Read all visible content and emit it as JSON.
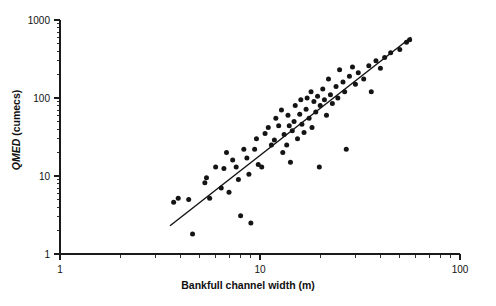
{
  "chart_data": {
    "type": "scatter",
    "title": "",
    "xlabel": "Bankfull channel width (m)",
    "ylabel": "QMED (cumecs)",
    "ylabel_italic_part": "QMED",
    "ylabel_rest": " (cumecs)",
    "xscale": "log",
    "yscale": "log",
    "xlim": [
      1,
      100
    ],
    "ylim": [
      1,
      1000
    ],
    "xticks": [
      1,
      10,
      100
    ],
    "xtick_labels": [
      "1",
      "10",
      "100"
    ],
    "yticks": [
      1,
      10,
      100,
      1000
    ],
    "ytick_labels": [
      "1",
      "10",
      "100",
      "1000"
    ],
    "grid": false,
    "legend": null,
    "series": [
      {
        "name": "Gauged catchments",
        "marker": "filled-circle",
        "color": "#141414",
        "points": [
          [
            3.7,
            4.6
          ],
          [
            3.9,
            5.2
          ],
          [
            4.4,
            5.0
          ],
          [
            4.6,
            1.8
          ],
          [
            5.3,
            8.2
          ],
          [
            5.4,
            9.5
          ],
          [
            5.6,
            5.2
          ],
          [
            6.0,
            13.0
          ],
          [
            6.4,
            7.0
          ],
          [
            6.6,
            12.5
          ],
          [
            6.8,
            20.0
          ],
          [
            7.0,
            6.2
          ],
          [
            7.3,
            16.0
          ],
          [
            7.6,
            13.0
          ],
          [
            7.8,
            9.0
          ],
          [
            8.0,
            3.1
          ],
          [
            8.3,
            22.0
          ],
          [
            8.6,
            17.0
          ],
          [
            8.8,
            10.5
          ],
          [
            9.0,
            2.5
          ],
          [
            9.4,
            22.0
          ],
          [
            9.6,
            30.0
          ],
          [
            9.8,
            14.0
          ],
          [
            10.2,
            13.0
          ],
          [
            10.6,
            35.0
          ],
          [
            11.0,
            42.0
          ],
          [
            11.4,
            25.0
          ],
          [
            11.8,
            29.0
          ],
          [
            12.0,
            55.0
          ],
          [
            12.4,
            44.0
          ],
          [
            12.8,
            70.0
          ],
          [
            13.0,
            20.0
          ],
          [
            13.2,
            34.0
          ],
          [
            13.6,
            25.0
          ],
          [
            13.8,
            60.0
          ],
          [
            14.0,
            44.0
          ],
          [
            14.2,
            15.0
          ],
          [
            14.5,
            38.0
          ],
          [
            14.8,
            50.0
          ],
          [
            15.0,
            80.0
          ],
          [
            15.4,
            30.0
          ],
          [
            15.8,
            62.0
          ],
          [
            16.0,
            95.0
          ],
          [
            16.2,
            46.0
          ],
          [
            16.6,
            36.0
          ],
          [
            17.0,
            72.0
          ],
          [
            17.2,
            100.0
          ],
          [
            17.6,
            55.0
          ],
          [
            18.0,
            120.0
          ],
          [
            18.2,
            42.0
          ],
          [
            18.6,
            90.0
          ],
          [
            19.0,
            66.0
          ],
          [
            19.4,
            105.0
          ],
          [
            19.8,
            13.0
          ],
          [
            20.0,
            80.0
          ],
          [
            20.6,
            130.0
          ],
          [
            21.0,
            95.0
          ],
          [
            21.5,
            60.0
          ],
          [
            22.0,
            175.0
          ],
          [
            22.5,
            110.0
          ],
          [
            23.0,
            85.0
          ],
          [
            24.0,
            140.0
          ],
          [
            24.5,
            100.0
          ],
          [
            25.0,
            230.0
          ],
          [
            26.0,
            160.0
          ],
          [
            26.5,
            120.0
          ],
          [
            27.0,
            22.0
          ],
          [
            28.0,
            190.0
          ],
          [
            29.0,
            250.0
          ],
          [
            30.0,
            150.0
          ],
          [
            31.0,
            210.0
          ],
          [
            33.0,
            175.0
          ],
          [
            35.0,
            260.0
          ],
          [
            36.0,
            120.0
          ],
          [
            38.0,
            300.0
          ],
          [
            40.0,
            240.0
          ],
          [
            42.0,
            330.0
          ],
          [
            45.0,
            380.0
          ],
          [
            50.0,
            420.0
          ],
          [
            54.0,
            520.0
          ],
          [
            56.0,
            560.0
          ]
        ]
      }
    ],
    "fit_line": {
      "name": "regression line",
      "type": "power-law",
      "endpoints": [
        [
          3.55,
          2.3
        ],
        [
          57.0,
          600.0
        ]
      ]
    }
  }
}
